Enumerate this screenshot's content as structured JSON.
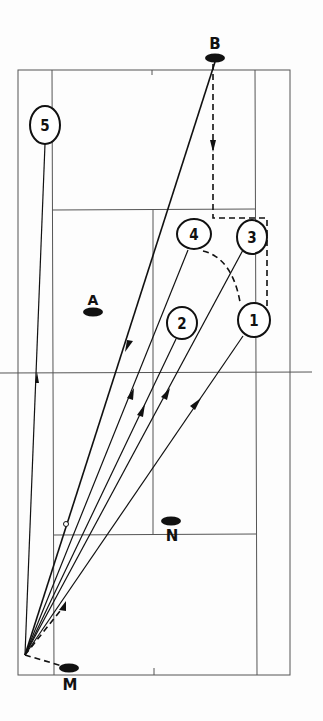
{
  "diagram": {
    "type": "badminton-court-tactical-diagram",
    "colors": {
      "ink": "#111111",
      "court_line": "#555555",
      "background": "#fdfdfd"
    },
    "players": [
      {
        "id": "B",
        "label": "B",
        "role": "opponent"
      },
      {
        "id": "A",
        "label": "A",
        "role": "opponent"
      },
      {
        "id": "N",
        "label": "N",
        "role": "partner"
      },
      {
        "id": "M",
        "label": "M",
        "role": "player"
      }
    ],
    "positions": [
      {
        "id": "1",
        "label": "1"
      },
      {
        "id": "2",
        "label": "2"
      },
      {
        "id": "3",
        "label": "3"
      },
      {
        "id": "4",
        "label": "4"
      },
      {
        "id": "5",
        "label": "5"
      }
    ],
    "shots": [
      {
        "from": "B",
        "to": "origin",
        "style": "solid-arrow"
      },
      {
        "from": "origin",
        "to": "1",
        "style": "solid-arrow"
      },
      {
        "from": "origin",
        "to": "2",
        "style": "solid-arrow"
      },
      {
        "from": "origin",
        "to": "3",
        "style": "solid-arrow"
      },
      {
        "from": "origin",
        "to": "4",
        "style": "solid-arrow"
      },
      {
        "from": "origin",
        "to": "5",
        "style": "solid-arrow"
      }
    ],
    "movements": [
      {
        "from": "B",
        "path": "4-3-1",
        "style": "dashed-arrow"
      },
      {
        "from": "4",
        "to": "1",
        "style": "dashed-arc"
      },
      {
        "from": "M",
        "to": "origin",
        "style": "dashed"
      },
      {
        "from": "origin",
        "style": "dashed-arrow-forward"
      }
    ]
  }
}
